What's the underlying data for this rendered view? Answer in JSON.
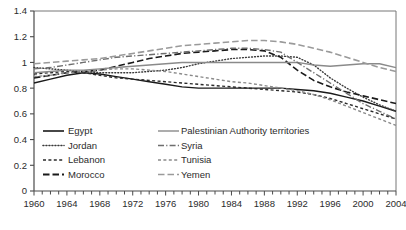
{
  "chart_data": {
    "type": "line",
    "title": "",
    "subtitle": "",
    "xlabel": "",
    "ylabel": "",
    "xlim": [
      1960,
      2004
    ],
    "ylim": [
      0,
      1.4
    ],
    "yticks": [
      "0",
      "0.2",
      "0.4",
      "0.6",
      "0.8",
      "1",
      "1.2",
      "1.4"
    ],
    "ytick_values": [
      0,
      0.2,
      0.4,
      0.6,
      0.8,
      1.0,
      1.2,
      1.4
    ],
    "xticks": [
      "1960",
      "1964",
      "1968",
      "1972",
      "1976",
      "1980",
      "1984",
      "1988",
      "1992",
      "1996",
      "2000",
      "2004"
    ],
    "xtick_values": [
      1960,
      1964,
      1968,
      1972,
      1976,
      1980,
      1984,
      1988,
      1992,
      1996,
      2000,
      2004
    ],
    "minor_tick_interval": 1,
    "grid": false,
    "legend_position": "inside-bottom-left",
    "x": [
      1960,
      1962,
      1964,
      1966,
      1968,
      1970,
      1972,
      1974,
      1976,
      1978,
      1980,
      1982,
      1984,
      1986,
      1988,
      1990,
      1992,
      1994,
      1996,
      1998,
      2000,
      2002,
      2004
    ],
    "series": [
      {
        "name": "Egypt",
        "dash": "solid",
        "color": "#1a1a1a",
        "width": 1.4,
        "values": [
          0.84,
          0.87,
          0.9,
          0.92,
          0.91,
          0.89,
          0.87,
          0.85,
          0.83,
          0.81,
          0.8,
          0.8,
          0.8,
          0.8,
          0.8,
          0.8,
          0.79,
          0.78,
          0.76,
          0.73,
          0.7,
          0.66,
          0.62
        ]
      },
      {
        "name": "Jordan",
        "dash": "dotted",
        "color": "#3a3a3a",
        "width": 1.4,
        "values": [
          0.96,
          0.95,
          0.94,
          0.93,
          0.92,
          0.92,
          0.92,
          0.93,
          0.94,
          0.96,
          0.99,
          1.01,
          1.03,
          1.04,
          1.05,
          1.05,
          1.04,
          0.98,
          0.88,
          0.8,
          0.73,
          0.67,
          0.62
        ]
      },
      {
        "name": "Lebanon",
        "dash": "dashed-short",
        "color": "#2b2b2b",
        "width": 1.4,
        "values": [
          0.91,
          0.92,
          0.93,
          0.92,
          0.9,
          0.88,
          0.87,
          0.86,
          0.85,
          0.84,
          0.83,
          0.82,
          0.81,
          0.8,
          0.79,
          0.78,
          0.77,
          0.75,
          0.72,
          0.68,
          0.64,
          0.6,
          0.56
        ]
      },
      {
        "name": "Morocco",
        "dash": "dashed-long",
        "color": "#1a1a1a",
        "width": 1.6,
        "values": [
          0.88,
          0.9,
          0.92,
          0.93,
          0.94,
          0.97,
          1.0,
          1.03,
          1.05,
          1.07,
          1.08,
          1.09,
          1.1,
          1.1,
          1.09,
          1.04,
          0.94,
          0.86,
          0.81,
          0.77,
          0.74,
          0.71,
          0.68
        ]
      },
      {
        "name": "Palestinian Authority territories",
        "dash": "solid",
        "color": "#8a8a8a",
        "width": 1.4,
        "values": [
          0.92,
          0.93,
          0.94,
          0.94,
          0.95,
          0.96,
          0.97,
          0.98,
          0.99,
          1.0,
          1.0,
          1.0,
          1.0,
          1.0,
          1.0,
          1.0,
          1.0,
          0.98,
          0.97,
          0.98,
          0.99,
          0.99,
          0.96
        ]
      },
      {
        "name": "Syria",
        "dash": "dash-dot",
        "color": "#6e6e6e",
        "width": 1.4,
        "values": [
          0.95,
          0.96,
          0.98,
          1.0,
          1.02,
          1.04,
          1.05,
          1.06,
          1.07,
          1.08,
          1.09,
          1.1,
          1.11,
          1.11,
          1.1,
          1.08,
          1.0,
          0.92,
          0.84,
          0.76,
          0.68,
          0.62,
          0.56
        ]
      },
      {
        "name": "Tunisia",
        "dash": "dashed-short",
        "color": "#8a8a8a",
        "width": 1.4,
        "values": [
          0.89,
          0.9,
          0.92,
          0.93,
          0.94,
          0.95,
          0.95,
          0.94,
          0.93,
          0.91,
          0.89,
          0.87,
          0.85,
          0.84,
          0.82,
          0.8,
          0.78,
          0.75,
          0.71,
          0.66,
          0.61,
          0.56,
          0.51
        ]
      },
      {
        "name": "Yemen",
        "dash": "dashed-long",
        "color": "#9a9a9a",
        "width": 1.6,
        "values": [
          0.99,
          1.0,
          1.01,
          1.02,
          1.03,
          1.05,
          1.07,
          1.09,
          1.11,
          1.13,
          1.14,
          1.15,
          1.16,
          1.17,
          1.17,
          1.16,
          1.14,
          1.11,
          1.08,
          1.04,
          1.0,
          0.96,
          0.93
        ]
      }
    ],
    "legend": [
      {
        "label": "Egypt",
        "dash": "solid",
        "color": "#1a1a1a",
        "width": 1.6
      },
      {
        "label": "Jordan",
        "dash": "dotted",
        "color": "#3a3a3a",
        "width": 1.6
      },
      {
        "label": "Lebanon",
        "dash": "dashed-short",
        "color": "#2b2b2b",
        "width": 1.6
      },
      {
        "label": "Morocco",
        "dash": "dashed-long",
        "color": "#1a1a1a",
        "width": 1.8
      },
      {
        "label": "Palestinian Authority territories",
        "dash": "solid",
        "color": "#8a8a8a",
        "width": 1.4
      },
      {
        "label": "Syria",
        "dash": "dash-dot",
        "color": "#6e6e6e",
        "width": 1.4
      },
      {
        "label": "Tunisia",
        "dash": "dashed-short",
        "color": "#8a8a8a",
        "width": 1.4
      },
      {
        "label": "Yemen",
        "dash": "dashed-long",
        "color": "#9a9a9a",
        "width": 1.6
      }
    ]
  }
}
